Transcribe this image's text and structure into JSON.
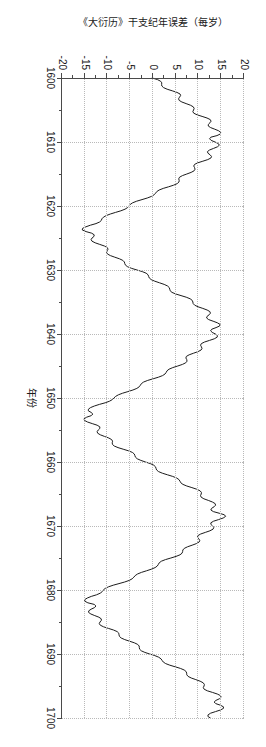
{
  "chart_data": {
    "type": "line",
    "title": "",
    "xlabel": "年份",
    "ylabel": "《大衍历》干支纪年误差（每岁）",
    "xlim": [
      1600,
      1700
    ],
    "ylim": [
      -20,
      20
    ],
    "xticks": [
      1600,
      1610,
      1620,
      1630,
      1640,
      1650,
      1660,
      1670,
      1680,
      1690,
      1700
    ],
    "xtick_labels": [
      "1600",
      "1610",
      "1620",
      "1630",
      "1640",
      "1650",
      "1660",
      "1670",
      "1680",
      "1690",
      "1700"
    ],
    "yticks": [
      20,
      15,
      10,
      5,
      0,
      -5,
      -10,
      -15,
      -20
    ],
    "ytick_labels": [
      "20",
      "15",
      "10",
      "5",
      "0",
      "-5",
      "-10",
      "-15",
      "-20"
    ],
    "grid": true,
    "grid_style": "dotted",
    "legend": "none",
    "line_color": "#1c1c1c",
    "grid_color": "#b9b9b9",
    "axis_color": "#4a4a4a",
    "background": "#ffffff",
    "orientation": "rotated-90-clockwise",
    "series": [
      {
        "name": "《大衍历》干支纪年误差（每岁）",
        "x": [
          1600,
          1601,
          1602,
          1603,
          1604,
          1605,
          1606,
          1607,
          1608,
          1609,
          1610,
          1611,
          1612,
          1613,
          1614,
          1615,
          1616,
          1617,
          1618,
          1619,
          1620,
          1621,
          1622,
          1623,
          1624,
          1625,
          1626,
          1627,
          1628,
          1629,
          1630,
          1631,
          1632,
          1633,
          1634,
          1635,
          1636,
          1637,
          1638,
          1639,
          1640,
          1641,
          1642,
          1643,
          1644,
          1645,
          1646,
          1647,
          1648,
          1649,
          1650,
          1651,
          1652,
          1653,
          1654,
          1655,
          1656,
          1657,
          1658,
          1659,
          1660,
          1661,
          1662,
          1663,
          1664,
          1665,
          1666,
          1667,
          1668,
          1669,
          1670,
          1671,
          1672,
          1673,
          1674,
          1675,
          1676,
          1677,
          1678,
          1679,
          1680,
          1681,
          1682,
          1683,
          1684,
          1685,
          1686,
          1687,
          1688,
          1689,
          1690,
          1691,
          1692,
          1693,
          1694,
          1695,
          1696,
          1697,
          1698,
          1699,
          1700
        ],
        "y": [
          0.2,
          2.0,
          4.0,
          5.6,
          7.4,
          9.2,
          10.8,
          12.2,
          13.4,
          14.4,
          14.0,
          13.2,
          12.2,
          10.9,
          9.4,
          7.6,
          5.6,
          3.2,
          0.6,
          -2.2,
          -5.2,
          -8.4,
          -11.4,
          -13.6,
          -14.2,
          -13.4,
          -12.0,
          -10.2,
          -8.2,
          -6.0,
          -3.6,
          -1.2,
          1.4,
          3.9,
          6.3,
          8.6,
          10.7,
          12.4,
          13.6,
          14.0,
          13.4,
          12.2,
          10.8,
          9.2,
          7.4,
          5.2,
          2.8,
          0.2,
          -2.6,
          -5.6,
          -8.8,
          -11.8,
          -13.9,
          -14.3,
          -13.6,
          -12.3,
          -10.6,
          -8.7,
          -6.5,
          -4.2,
          -1.8,
          0.8,
          3.4,
          5.9,
          8.3,
          10.5,
          12.4,
          13.7,
          14.3,
          14.0,
          13.1,
          11.8,
          10.2,
          8.4,
          6.3,
          4.0,
          1.4,
          -1.4,
          -4.4,
          -7.6,
          -10.8,
          -13.3,
          -14.4,
          -14.0,
          -12.9,
          -11.4,
          -9.6,
          -7.6,
          -5.4,
          -3.0,
          -0.5,
          2.1,
          4.7,
          7.2,
          9.5,
          11.5,
          13.1,
          14.2,
          14.5,
          14.0,
          13.0
        ],
        "ripple_amplitude": 1.6,
        "ripple_period_years": 2,
        "description": "准周期锯齿波，周期约29年，峰值约 +15，谷值约 -15，叠加约 ±1.6 的高频抖动"
      }
    ]
  },
  "axes": {
    "x_title": "年份",
    "y_title": "《大衍历》干支纪年误差（每岁）"
  }
}
